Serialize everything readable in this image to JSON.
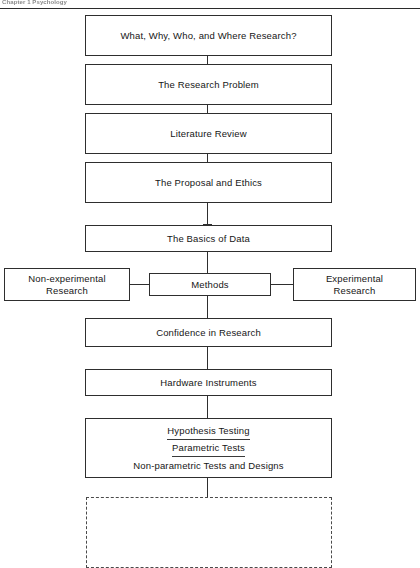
{
  "header": {
    "running_head": "Chapter 1  Psychology",
    "rule": "horizontal-rule"
  },
  "diagram": {
    "type": "flowchart",
    "orientation": "vertical",
    "nodes": [
      {
        "id": "n1",
        "label": "What, Why, Who, and Where Research?",
        "shape": "rectangle",
        "column": "center"
      },
      {
        "id": "n2",
        "label": "The Research Problem",
        "shape": "rectangle",
        "column": "center"
      },
      {
        "id": "n3",
        "label": "Literature Review",
        "shape": "rectangle",
        "column": "center"
      },
      {
        "id": "n4",
        "label": "The Proposal and Ethics",
        "shape": "rectangle",
        "column": "center"
      },
      {
        "id": "n5",
        "label": "The Basics of Data",
        "shape": "rectangle",
        "column": "center"
      },
      {
        "id": "n6",
        "label": "Methods",
        "shape": "rectangle",
        "column": "center"
      },
      {
        "id": "n6l",
        "label_line1": "Non-experimental",
        "label_line2": "Research",
        "shape": "rectangle",
        "column": "left"
      },
      {
        "id": "n6r",
        "label_line1": "Experimental",
        "label_line2": "Research",
        "shape": "rectangle",
        "column": "right"
      },
      {
        "id": "n7",
        "label": "Confidence in Research",
        "shape": "rectangle",
        "column": "center"
      },
      {
        "id": "n8",
        "label": "Hardware Instruments",
        "shape": "rectangle",
        "column": "center"
      },
      {
        "id": "n9",
        "shape": "rectangle",
        "column": "center",
        "lines": [
          {
            "text": "Hypothesis Testing",
            "underlined": true
          },
          {
            "text": "Parametric Tests",
            "underlined": true
          },
          {
            "text": "Non-parametric Tests and Designs",
            "underlined": false
          }
        ]
      },
      {
        "id": "n10",
        "label": "",
        "shape": "dashed-rectangle",
        "column": "center",
        "empty": true
      }
    ],
    "edges": [
      {
        "from": "n1",
        "to": "n2",
        "style": "solid",
        "direction": "down"
      },
      {
        "from": "n2",
        "to": "n3",
        "style": "solid",
        "direction": "down"
      },
      {
        "from": "n3",
        "to": "n4",
        "style": "solid",
        "direction": "down"
      },
      {
        "from": "n4",
        "to": "n5",
        "style": "solid",
        "direction": "down",
        "arrow": true
      },
      {
        "from": "n5",
        "to": "n6",
        "style": "solid",
        "direction": "down"
      },
      {
        "from": "n6l",
        "to": "n6",
        "style": "solid",
        "direction": "right"
      },
      {
        "from": "n6",
        "to": "n6r",
        "style": "solid",
        "direction": "right"
      },
      {
        "from": "n6",
        "to": "n7",
        "style": "solid",
        "direction": "down"
      },
      {
        "from": "n7",
        "to": "n8",
        "style": "solid",
        "direction": "down"
      },
      {
        "from": "n8",
        "to": "n9",
        "style": "solid",
        "direction": "down"
      },
      {
        "from": "n9",
        "to": "n10",
        "style": "solid",
        "direction": "down"
      }
    ],
    "colors": {
      "stroke": "#2e2e2e",
      "dashed_stroke": "#4a4a4a",
      "text": "#161616",
      "background": "#ffffff"
    }
  }
}
